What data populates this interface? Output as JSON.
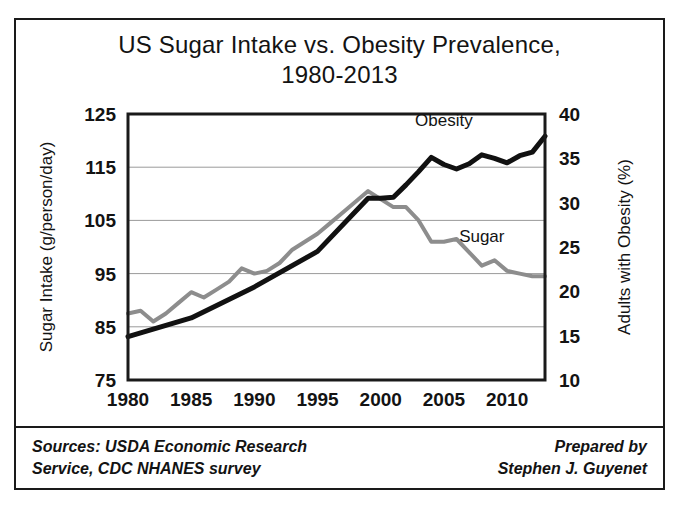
{
  "figure": {
    "title_line1": "US Sugar Intake vs. Obesity Prevalence,",
    "title_line2": "1980-2013",
    "border_color": "#1a1a1a",
    "background": "#ffffff"
  },
  "footer": {
    "sources_line1": "Sources: USDA Economic Research",
    "sources_line2": "Service, CDC NHANES survey",
    "prepared_line1": "Prepared by",
    "prepared_line2": "Stephen J. Guyenet"
  },
  "chart_data": {
    "type": "line",
    "title": "US Sugar Intake vs. Obesity Prevalence, 1980-2013",
    "xlabel": "",
    "ylabel": "Sugar Intake (g/person/day)",
    "y2label": "Adults with Obesity (%)",
    "xlim": [
      1980,
      2013
    ],
    "ylim": [
      75,
      125
    ],
    "y2lim": [
      10,
      40
    ],
    "xticks": [
      1980,
      1985,
      1990,
      1995,
      2000,
      2005,
      2010
    ],
    "xticklabels": [
      "1980",
      "1985",
      "1990",
      "1995",
      "2000",
      "2005",
      "2010"
    ],
    "yticks": [
      75,
      85,
      95,
      105,
      115,
      125
    ],
    "yticklabels": [
      "75",
      "85",
      "95",
      "105",
      "115",
      "125"
    ],
    "y2ticks": [
      10,
      15,
      20,
      25,
      30,
      35,
      40
    ],
    "y2ticklabels": [
      "10",
      "15",
      "20",
      "25",
      "30",
      "35",
      "40"
    ],
    "grid": true,
    "grid_axis": "y",
    "legend": "inline-labels",
    "series": [
      {
        "name": "Sugar",
        "axis": "left",
        "unit": "g/person/day",
        "color": "#8d8d8d",
        "label_x": 2008,
        "label_y": 101,
        "x": [
          1980,
          1981,
          1982,
          1983,
          1984,
          1985,
          1986,
          1987,
          1988,
          1989,
          1990,
          1991,
          1992,
          1993,
          1994,
          1995,
          1996,
          1997,
          1998,
          1999,
          2000,
          2001,
          2002,
          2003,
          2004,
          2005,
          2006,
          2007,
          2008,
          2009,
          2010,
          2011,
          2012,
          2013
        ],
        "values": [
          87.5,
          88.0,
          86.0,
          87.5,
          89.5,
          91.5,
          90.5,
          92.0,
          93.5,
          96.0,
          95.0,
          95.5,
          97.0,
          99.5,
          101.0,
          102.5,
          104.5,
          106.5,
          108.5,
          110.5,
          109.0,
          107.5,
          107.5,
          105.0,
          101.0,
          101.0,
          101.5,
          99.0,
          96.5,
          97.5,
          95.5,
          95.0,
          94.5,
          94.5
        ]
      },
      {
        "name": "Obesity",
        "axis": "right",
        "unit": "%",
        "color": "#111111",
        "label_x": 2005,
        "label_y_pct": 38.6,
        "x": [
          1980,
          1985,
          1990,
          1995,
          1999,
          2000,
          2001,
          2002,
          2003,
          2004,
          2005,
          2006,
          2007,
          2008,
          2009,
          2010,
          2011,
          2012,
          2013
        ],
        "values": [
          14.9,
          17.0,
          20.5,
          24.5,
          30.5,
          30.5,
          30.6,
          32.0,
          33.5,
          35.1,
          34.3,
          33.8,
          34.4,
          35.4,
          35.0,
          34.5,
          35.3,
          35.7,
          37.5
        ]
      }
    ]
  }
}
